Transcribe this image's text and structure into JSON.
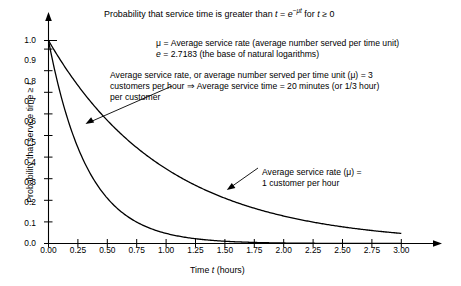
{
  "chart_data": {
    "type": "line",
    "title": "Probability that service time is greater than t = e−μt for t ≥ 0",
    "xlabel": "Time t (hours)",
    "ylabel": "Probability that service time ≥ t",
    "xlim": [
      0,
      3.0
    ],
    "ylim": [
      0,
      1.0
    ],
    "grid": false,
    "legend_position": "none",
    "x_ticks": [
      "0.00",
      "0.25",
      "0.50",
      "0.75",
      "1.00",
      "1.25",
      "1.50",
      "1.75",
      "2.00",
      "2.25",
      "2.50",
      "2.75",
      "3.00"
    ],
    "x_tick_values": [
      0,
      0.25,
      0.5,
      0.75,
      1.0,
      1.25,
      1.5,
      1.75,
      2.0,
      2.25,
      2.5,
      2.75,
      3.0
    ],
    "y_ticks": [
      "0.0",
      "0.1",
      "0.2",
      "0.3",
      "0.4",
      "0.5",
      "0.6",
      "0.7",
      "0.8",
      "0.9",
      "1.0"
    ],
    "y_tick_values": [
      0,
      0.1,
      0.2,
      0.3,
      0.4,
      0.5,
      0.6,
      0.7,
      0.8,
      0.9,
      1.0
    ],
    "x": [
      0,
      0.25,
      0.5,
      0.75,
      1.0,
      1.25,
      1.5,
      1.75,
      2.0,
      2.25,
      2.5,
      2.75,
      3.0
    ],
    "series": [
      {
        "name": "mu = 3 customers per hour",
        "mu": 3,
        "formula": "e^(-3t)",
        "values": [
          1.0,
          0.472,
          0.223,
          0.105,
          0.05,
          0.024,
          0.011,
          0.005,
          0.002,
          0.001,
          0.001,
          0.0,
          0.0
        ]
      },
      {
        "name": "mu = 1 customer per hour",
        "mu": 1,
        "formula": "e^(-t)",
        "values": [
          1.0,
          0.779,
          0.607,
          0.472,
          0.368,
          0.287,
          0.223,
          0.174,
          0.135,
          0.105,
          0.082,
          0.064,
          0.05
        ]
      }
    ],
    "annotations": [
      {
        "id": "mu-definition",
        "lines": [
          "μ = Average service rate (average number served per time unit)",
          "e = 2.7183 (the base of natural logarithms)"
        ]
      },
      {
        "id": "mu-3-callout",
        "lines": [
          "Average service rate, or average number served per time unit (μ) = 3",
          "customers per hour ⇒ Average service time = 20 minutes (or 1/3 hour)",
          "per customer"
        ]
      },
      {
        "id": "mu-1-callout",
        "lines": [
          "Average service rate (μ) =",
          "1 customer per hour"
        ]
      }
    ]
  },
  "title_parts": {
    "lead": "Probability that service time is greater than ",
    "t_var": "t",
    "equals": " = ",
    "e_var": "e",
    "exponent": "−μt",
    "tail_for": " for ",
    "t_var2": "t",
    "tail_cond": " ≥ 0"
  },
  "notes": {
    "mu_line_pre": "μ = Average service rate (average number served per time unit)",
    "e_line_var": "e",
    "e_line_rest": " = 2.7183 (the base of natural logarithms)"
  },
  "annotation_mu3": {
    "line1": "Average service rate, or average number served per time unit (μ) = 3",
    "line2": "customers per hour ⇒ Average service time = 20 minutes (or 1/3 hour)",
    "line3": "per customer"
  },
  "annotation_mu1": {
    "line1": "Average service rate (μ) =",
    "line2": "1 customer per hour"
  },
  "axis_titles": {
    "x_pre": "Time ",
    "x_var": "t",
    "x_post": " (hours)",
    "y_pre": "Probability that service time ≥ ",
    "y_var": "t"
  }
}
